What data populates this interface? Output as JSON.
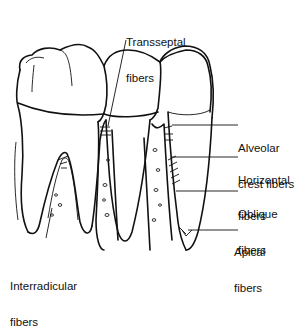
{
  "labels": {
    "transseptal": [
      "Transseptal",
      "fibers"
    ],
    "alveolar_crest": [
      "Alveolar",
      "crest fibers"
    ],
    "horizontal": [
      "Horizontal",
      "fibers"
    ],
    "oblique": [
      "Oblique",
      "fibers"
    ],
    "apical": [
      "Apical",
      "fibers"
    ],
    "interradicular": [
      "Interradicular",
      "fibers"
    ]
  },
  "colors": {
    "ink": "#111111",
    "background": "#ffffff"
  }
}
